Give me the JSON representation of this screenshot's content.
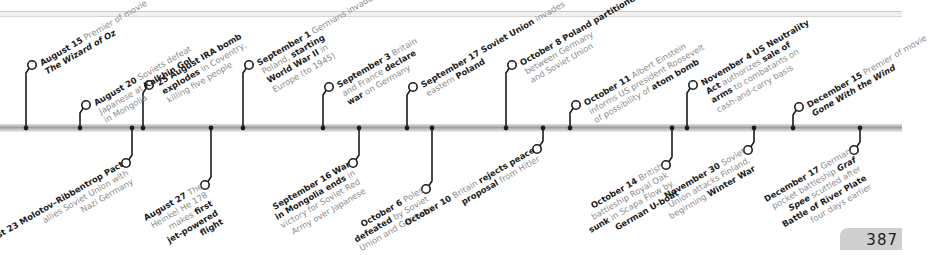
{
  "page": {
    "number": "387"
  },
  "timeline": {
    "top_events": [
      {
        "id": "aug15",
        "tick_x": 26,
        "circle_y": 65,
        "date": "August 15",
        "lines": [
          [
            {
              "t": "Premier of movie"
            }
          ],
          [
            {
              "t": "The Wizard of Oz",
              "s": "i"
            }
          ]
        ]
      },
      {
        "id": "aug20",
        "tick_x": 80,
        "circle_y": 105,
        "date": "August 20",
        "lines": [
          [
            {
              "t": "Soviets defeat"
            }
          ],
          [
            {
              "t": "Japanese at "
            },
            {
              "t": "Kalkhin Gol",
              "s": "b"
            }
          ],
          [
            {
              "t": "in Mongolia"
            }
          ]
        ]
      },
      {
        "id": "aug25",
        "tick_x": 143,
        "circle_y": 85,
        "date": "25 August",
        "lines": [
          [
            {
              "t": "IRA bomb",
              "s": "b"
            }
          ],
          [
            {
              "t": "explodes",
              "s": "b"
            },
            {
              "t": " in Coventry,"
            }
          ],
          [
            {
              "t": "killing five people"
            }
          ]
        ]
      },
      {
        "id": "sep1",
        "tick_x": 243,
        "circle_y": 65,
        "date": "September 1",
        "lines": [
          [
            {
              "t": "Germans invade"
            }
          ],
          [
            {
              "t": "Poland, "
            },
            {
              "t": "starting",
              "s": "b"
            }
          ],
          [
            {
              "t": "World War II",
              "s": "b"
            },
            {
              "t": " in"
            }
          ],
          [
            {
              "t": "Europe (to 1945)"
            }
          ]
        ]
      },
      {
        "id": "sep3",
        "tick_x": 323,
        "circle_y": 87,
        "date": "September 3",
        "lines": [
          [
            {
              "t": "Britain"
            }
          ],
          [
            {
              "t": "and France "
            },
            {
              "t": "declare",
              "s": "b"
            }
          ],
          [
            {
              "t": "war",
              "s": "b"
            },
            {
              "t": " on Germany"
            }
          ]
        ]
      },
      {
        "id": "sep17",
        "tick_x": 407,
        "circle_y": 87,
        "date": "September 17",
        "lines": [
          [
            {
              "t": "Soviet Union",
              "s": "b"
            },
            {
              "t": " invades"
            }
          ],
          [
            {
              "t": "eastern "
            },
            {
              "t": "Poland",
              "s": "b"
            }
          ]
        ]
      },
      {
        "id": "oct8",
        "tick_x": 506,
        "circle_y": 65,
        "date": "October 8",
        "lines": [
          [
            {
              "t": "Poland partitioned",
              "s": "b"
            }
          ],
          [
            {
              "t": "between Germany"
            }
          ],
          [
            {
              "t": "and Soviet Union"
            }
          ]
        ]
      },
      {
        "id": "oct11",
        "tick_x": 570,
        "circle_y": 105,
        "date": "October 11",
        "lines": [
          [
            {
              "t": "Albert Einstein"
            }
          ],
          [
            {
              "t": "informs US president Roosevelt"
            }
          ],
          [
            {
              "t": "of possibility of "
            },
            {
              "t": "atom bomb",
              "s": "b"
            }
          ]
        ]
      },
      {
        "id": "nov4",
        "tick_x": 687,
        "circle_y": 85,
        "date": "November 4",
        "lines": [
          [
            {
              "t": "US Neutrality",
              "s": "b"
            }
          ],
          [
            {
              "t": "Act",
              "s": "b"
            },
            {
              "t": " authorizes "
            },
            {
              "t": "sale of",
              "s": "b"
            }
          ],
          [
            {
              "t": "arms",
              "s": "b"
            },
            {
              "t": " to combatants on"
            }
          ],
          [
            {
              "t": "cash-and-carry basis"
            }
          ]
        ]
      },
      {
        "id": "dec15",
        "tick_x": 793,
        "circle_y": 107,
        "date": "December 15",
        "lines": [
          [
            {
              "t": "Premier of movie"
            }
          ],
          [
            {
              "t": "Gone With the Wind",
              "s": "i"
            }
          ]
        ]
      }
    ],
    "bottom_events": [
      {
        "id": "aug23",
        "tick_x": 132,
        "circle_y": 163,
        "date": "August 23",
        "lines": [
          [
            {
              "t": "Molotov–Ribbentrop Pact",
              "s": "b"
            }
          ],
          [
            {
              "t": "allies Soviet Union with"
            }
          ],
          [
            {
              "t": "Nazi Germany"
            }
          ]
        ]
      },
      {
        "id": "aug27",
        "tick_x": 211,
        "circle_y": 185,
        "date": "August 27",
        "lines": [
          [
            {
              "t": "The"
            }
          ],
          [
            {
              "t": "Heinkel He 178"
            }
          ],
          [
            {
              "t": "makes "
            },
            {
              "t": "first",
              "s": "b"
            }
          ],
          [
            {
              "t": "jet-powered",
              "s": "b"
            }
          ],
          [
            {
              "t": "flight",
              "s": "b"
            }
          ]
        ]
      },
      {
        "id": "sep16",
        "tick_x": 359,
        "circle_y": 163,
        "date": "September 16",
        "lines": [
          [
            {
              "t": "War",
              "s": "b"
            }
          ],
          [
            {
              "t": "in Mongolia ends",
              "s": "b"
            },
            {
              "t": " in"
            }
          ],
          [
            {
              "t": "victory for Soviet Red"
            }
          ],
          [
            {
              "t": "Army over Japanese"
            }
          ]
        ]
      },
      {
        "id": "oct6",
        "tick_x": 432,
        "circle_y": 189,
        "date": "October 6",
        "lines": [
          [
            {
              "t": "Poles"
            }
          ],
          [
            {
              "t": "defeated",
              "s": "b"
            },
            {
              "t": " by Soviet"
            }
          ],
          [
            {
              "t": "Union and Germany"
            }
          ]
        ]
      },
      {
        "id": "oct10",
        "tick_x": 543,
        "circle_y": 149,
        "date": "October 10",
        "lines": [
          [
            {
              "t": "Britain "
            },
            {
              "t": "rejects peace",
              "s": "b"
            }
          ],
          [
            {
              "t": "proposal",
              "s": "b"
            },
            {
              "t": " from Hitler"
            }
          ]
        ]
      },
      {
        "id": "oct14",
        "tick_x": 672,
        "circle_y": 165,
        "date": "October 14",
        "lines": [
          [
            {
              "t": "British"
            }
          ],
          [
            {
              "t": "battleship Royal Oak"
            }
          ],
          [
            {
              "t": "sunk",
              "s": "b"
            },
            {
              "t": " in Scapa Flow by"
            }
          ],
          [
            {
              "t": "German U-boat",
              "s": "b"
            }
          ]
        ]
      },
      {
        "id": "nov30",
        "tick_x": 754,
        "circle_y": 150,
        "date": "November 30",
        "lines": [
          [
            {
              "t": "Soviet"
            }
          ],
          [
            {
              "t": "Union attacks Finland,"
            }
          ],
          [
            {
              "t": "beginning "
            },
            {
              "t": "Winter War",
              "s": "b"
            }
          ]
        ]
      },
      {
        "id": "dec17",
        "tick_x": 860,
        "circle_y": 150,
        "date": "December 17",
        "lines": [
          [
            {
              "t": "German"
            }
          ],
          [
            {
              "t": "pocket battleship "
            },
            {
              "t": "Graf",
              "s": "i"
            }
          ],
          [
            {
              "t": "Spee",
              "s": "i"
            },
            {
              "t": " scuttled after"
            }
          ],
          [
            {
              "t": "Battle of River Plate",
              "s": "b"
            }
          ],
          [
            {
              "t": "four days earlier"
            }
          ]
        ]
      }
    ]
  },
  "colors": {
    "ink": "#1c1c1c",
    "muted": "#8a8a8a",
    "bar": "#a8a8a8",
    "page_tab": "#cfcfcf"
  }
}
